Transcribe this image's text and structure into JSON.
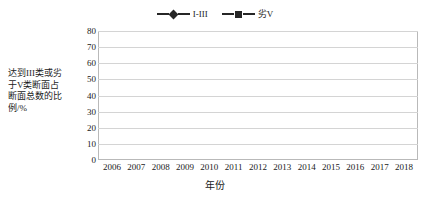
{
  "chart_data": {
    "type": "line",
    "title": "",
    "xlabel": "年份",
    "ylabel": "达到III类或劣于V类断面占断面总数的比例/%",
    "ylabel_lines": [
      "达到III类或劣",
      "于V类断面占",
      "断面总数的比",
      "例/%"
    ],
    "categories": [
      "2006",
      "2007",
      "2008",
      "2009",
      "2010",
      "2011",
      "2012",
      "2013",
      "2014",
      "2015",
      "2016",
      "2017",
      "2018"
    ],
    "x": [
      2006,
      2007,
      2008,
      2009,
      2010,
      2011,
      2012,
      2013,
      2014,
      2015,
      2016,
      2017,
      2018
    ],
    "series": [
      {
        "name": "I-III",
        "marker": "diamond",
        "color": "#262626",
        "values": [
          50,
          64,
          68,
          68,
          68,
          69.5,
          60.5,
          58,
          59.5,
          61,
          59,
          57.5,
          66
        ]
      },
      {
        "name": "劣V",
        "marker": "square",
        "color": "#262626",
        "values": [
          25,
          22.5,
          20.5,
          25,
          20.5,
          18.5,
          17.5,
          16,
          12.5,
          12,
          13.5,
          15.5,
          11.5
        ]
      }
    ],
    "ylim": [
      0,
      80
    ],
    "ytick_values": [
      0,
      10,
      20,
      30,
      40,
      50,
      60,
      70,
      80
    ],
    "ytick_labels": [
      "0",
      "10",
      "20",
      "30",
      "40",
      "50",
      "60",
      "70",
      "80"
    ],
    "grid": true,
    "legend_position": "top-center"
  },
  "legend": {
    "items": [
      {
        "label": "I-III",
        "marker": "diamond"
      },
      {
        "label": "劣V",
        "marker": "square"
      }
    ]
  },
  "colors": {
    "series": "#262626",
    "grid": "#d4d4d4",
    "frame": "#b9b9b9",
    "background": "#ffffff"
  }
}
